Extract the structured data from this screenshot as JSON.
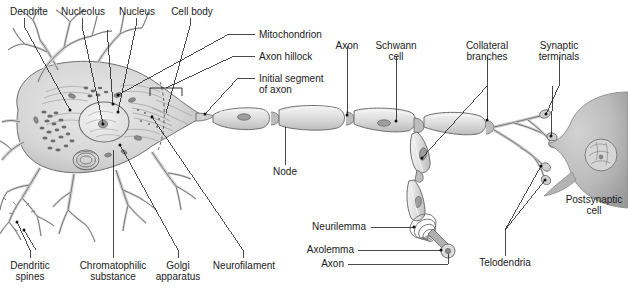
{
  "figure": {
    "type": "anatomical-diagram",
    "background_color": "#ffffff",
    "line_color": "#1a1a1a",
    "cell_fill_color": "#d8d8d8",
    "cell_stroke_color": "#7a7a7a",
    "nucleus_fill_color": "#ededed",
    "myelin_fill_color": "#e2e2e2",
    "postsynaptic_fill_color": "#b9b9b9"
  },
  "labels": {
    "dendrite": "Dendrite",
    "nucleolus": "Nucleolus",
    "nucleus": "Nucleus",
    "cell_body": "Cell body",
    "mitochondrion": "Mitochondrion",
    "axon_hillock": "Axon hillock",
    "initial_segment_line1": "Initial segment",
    "initial_segment_line2": "of axon",
    "axon_top": "Axon",
    "schwann_line1": "Schwann",
    "schwann_line2": "cell",
    "collateral_line1": "Collateral",
    "collateral_line2": "branches",
    "synaptic_line1": "Synaptic",
    "synaptic_line2": "terminals",
    "node": "Node",
    "postsynaptic_line1": "Postsynaptic",
    "postsynaptic_line2": "cell",
    "neurilemma": "Neurilemma",
    "axolemma": "Axolemma",
    "axon_bottom": "Axon",
    "telodendria": "Telodendria",
    "dendritic_line1": "Dendritic",
    "dendritic_line2": "spines",
    "chromatophilic_line1": "Chromatophilic",
    "chromatophilic_line2": "substance",
    "golgi_line1": "Golgi",
    "golgi_line2": "apparatus",
    "neurofilament": "Neurofilament"
  }
}
